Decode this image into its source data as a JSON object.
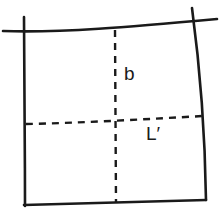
{
  "figure": {
    "background_color": "#ffffff",
    "stroke_color": "#1a1a1a",
    "width": 221,
    "height": 214,
    "labels": {
      "vertical_center_line": "b",
      "horizontal_center_line": "L′"
    },
    "geometry": {
      "top_edge": {
        "style": "solid",
        "path": "M 3 31 C 60 33, 130 27, 217 19",
        "name": "top-edge"
      },
      "left_edge": {
        "style": "solid",
        "path": "M 24 17 C 24 70, 25 140, 25 206",
        "name": "left-edge"
      },
      "right_edge": {
        "style": "solid",
        "path": "M 192 8 C 199 60, 205 130, 206 200",
        "name": "right-edge"
      },
      "bottom_edge": {
        "style": "solid",
        "path": "M 24 205 L 206 200",
        "name": "bottom-edge"
      },
      "vertical_center_line": {
        "style": "dashed",
        "path": "M 115 30 L 116 203",
        "name": "vertical-center-line"
      },
      "horizontal_center_line": {
        "style": "dashed",
        "path": "M 26 124 C 80 123, 150 119, 203 116",
        "name": "horizontal-center-line"
      },
      "intersection_point": {
        "x": 115,
        "y": 122
      }
    }
  }
}
